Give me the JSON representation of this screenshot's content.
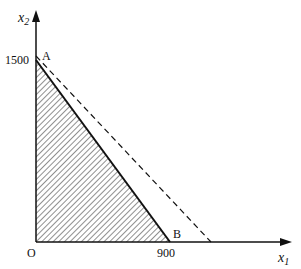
{
  "diagram": {
    "axes": {
      "x_label": "x",
      "x_subscript": "1",
      "y_label": "x",
      "y_subscript": "2",
      "origin_label": "O"
    },
    "ticks": {
      "y_tick": "1500",
      "x_tick": "900"
    },
    "points": {
      "A": "A",
      "B": "B"
    },
    "colors": {
      "line": "#111111",
      "background": "#ffffff"
    },
    "regions": [
      {
        "name": "feasible-region",
        "vertices": [
          "O",
          "A",
          "B"
        ],
        "fill": "hatched"
      }
    ],
    "lines": [
      {
        "name": "constraint-line-AB",
        "style": "solid",
        "from": "A (0,1500)",
        "to": "B (900,0)"
      },
      {
        "name": "objective-line",
        "style": "dashed"
      }
    ]
  }
}
